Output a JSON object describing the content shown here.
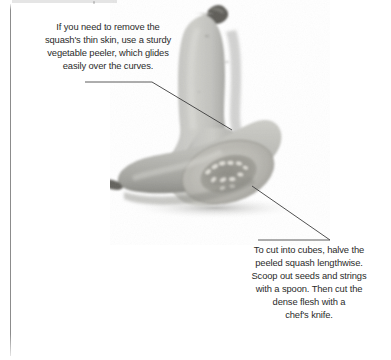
{
  "page": {
    "background_color": "#ffffff",
    "text_color": "#2b2b2b",
    "rule_color": "#4a4a4a",
    "margin_rule_color": "#787878"
  },
  "photo": {
    "subject": "butternut-squash",
    "description": "Grayscale photograph of a whole upright butternut squash behind a squash half cut lengthwise showing the seed cavity",
    "style": "black-and-white",
    "tones": {
      "flesh_light": "#c8c8c6",
      "flesh_mid": "#a9a9a6",
      "flesh_dark": "#8e8e8b",
      "stem": "#5d5c58",
      "cavity": "#96958f",
      "seed": "#dedcd6",
      "shadow": "#bfbfbd"
    }
  },
  "captions": [
    {
      "id": "peeler",
      "text": "If you need to remove the\nsquash's thin skin, use a sturdy\nvegetable peeler, which glides\neasily over the curves.",
      "rule": true,
      "leader_target": "whole-squash-body"
    },
    {
      "id": "cubes",
      "text": "To cut into cubes, halve the\npeeled squash lengthwise.\nScoop out seeds and strings\nwith a spoon. Then cut the\ndense flesh with a\nchef's knife.",
      "rule": true,
      "leader_target": "squash-seed-cavity"
    }
  ]
}
